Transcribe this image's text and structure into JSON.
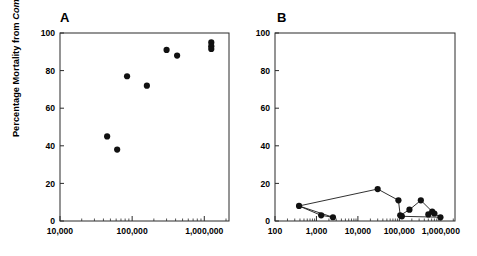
{
  "figure": {
    "background_color": "#ffffff",
    "marker_color": "#111111",
    "axis_color": "#2b2b2b",
    "y_axis_label_prefix": "Percentage Mortality from ",
    "y_axis_label_genus": "Compsilura"
  },
  "panels": [
    {
      "letter": "A",
      "y_ticks": [
        "0",
        "20",
        "40",
        "60",
        "80",
        "100"
      ],
      "x_ticks": [
        "10,000",
        "100,000",
        "1,000,000"
      ]
    },
    {
      "letter": "B",
      "y_ticks": [
        "0",
        "20",
        "40",
        "60",
        "80",
        "100"
      ],
      "x_ticks": [
        "100",
        "1,000",
        "10,000",
        "100,000",
        "1,000,000"
      ]
    }
  ],
  "chart_data": [
    {
      "type": "scatter",
      "title": "A",
      "xlabel": "",
      "ylabel": "Percentage Mortality from Compsilura",
      "xscale": "log",
      "xlim": [
        10000,
        2200000
      ],
      "ylim": [
        0,
        100
      ],
      "x_tick_values": [
        10000,
        100000,
        1000000
      ],
      "x_tick_labels": [
        "10,000",
        "100,000",
        "1,000,000"
      ],
      "y_tick_values": [
        0,
        20,
        40,
        60,
        80,
        100
      ],
      "y_tick_labels": [
        "0",
        "20",
        "40",
        "60",
        "80",
        "100"
      ],
      "grid": false,
      "legend": "none",
      "points": [
        {
          "x": 45000,
          "y": 45
        },
        {
          "x": 62000,
          "y": 38
        },
        {
          "x": 85000,
          "y": 77
        },
        {
          "x": 160000,
          "y": 72
        },
        {
          "x": 300000,
          "y": 91
        },
        {
          "x": 420000,
          "y": 88
        },
        {
          "x": 1250000,
          "y": 95
        },
        {
          "x": 1250000,
          "y": 93
        },
        {
          "x": 1250000,
          "y": 91.5
        }
      ]
    },
    {
      "type": "line",
      "title": "B",
      "xlabel": "",
      "ylabel": "",
      "xscale": "log",
      "xlim": [
        100,
        2200000
      ],
      "ylim": [
        0,
        100
      ],
      "x_tick_values": [
        100,
        1000,
        10000,
        100000,
        1000000
      ],
      "x_tick_labels": [
        "100",
        "1,000",
        "10,000",
        "100,000",
        "1,000,000"
      ],
      "y_tick_values": [
        0,
        20,
        40,
        60,
        80,
        100
      ],
      "y_tick_labels": [
        "0",
        "20",
        "40",
        "60",
        "80",
        "100"
      ],
      "grid": false,
      "legend": "none",
      "markers": true,
      "points": [
        {
          "x": 380,
          "y": 8
        },
        {
          "x": 1300,
          "y": 3
        },
        {
          "x": 2500,
          "y": 2
        },
        {
          "x": 30000,
          "y": 17
        },
        {
          "x": 95000,
          "y": 11
        },
        {
          "x": 105000,
          "y": 3
        },
        {
          "x": 115000,
          "y": 2.5
        },
        {
          "x": 175000,
          "y": 6
        },
        {
          "x": 330000,
          "y": 11
        },
        {
          "x": 500000,
          "y": 3.5
        },
        {
          "x": 620000,
          "y": 5
        },
        {
          "x": 700000,
          "y": 4
        },
        {
          "x": 980000,
          "y": 2
        }
      ],
      "line_path_order": [
        {
          "x": 380,
          "y": 8
        },
        {
          "x": 1300,
          "y": 3
        },
        {
          "x": 2500,
          "y": 2
        },
        {
          "x": 380,
          "y": 8
        },
        {
          "x": 30000,
          "y": 17
        },
        {
          "x": 95000,
          "y": 11
        },
        {
          "x": 105000,
          "y": 3
        },
        {
          "x": 175000,
          "y": 6
        },
        {
          "x": 330000,
          "y": 11
        },
        {
          "x": 620000,
          "y": 5
        },
        {
          "x": 700000,
          "y": 4
        },
        {
          "x": 980000,
          "y": 2
        },
        {
          "x": 115000,
          "y": 2.5
        },
        {
          "x": 105000,
          "y": 3
        }
      ]
    }
  ]
}
